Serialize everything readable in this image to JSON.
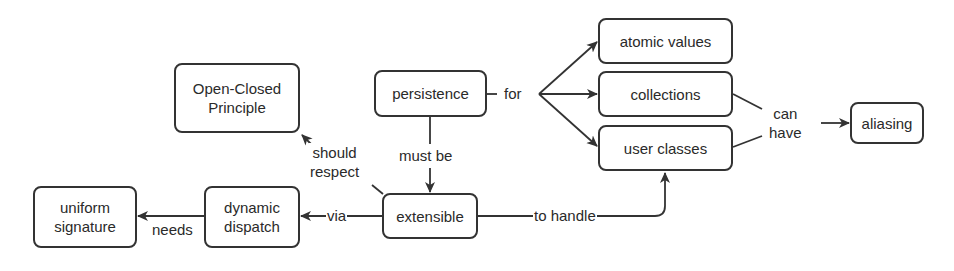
{
  "diagram": {
    "type": "concept-map",
    "stroke_color": "#333333",
    "text_color": "#2a2a2a",
    "nodes": [
      {
        "id": "open_closed",
        "label": "Open-Closed\nPrinciple"
      },
      {
        "id": "persistence",
        "label": "persistence"
      },
      {
        "id": "atomic_values",
        "label": "atomic values"
      },
      {
        "id": "collections",
        "label": "collections"
      },
      {
        "id": "user_classes",
        "label": "user classes"
      },
      {
        "id": "aliasing",
        "label": "aliasing"
      },
      {
        "id": "extensible",
        "label": "extensible"
      },
      {
        "id": "dynamic_dispatch",
        "label": "dynamic\ndispatch"
      },
      {
        "id": "uniform_signature",
        "label": "uniform\nsignature"
      }
    ],
    "edges": [
      {
        "from": "persistence",
        "to": [
          "atomic_values",
          "collections",
          "user_classes"
        ],
        "label": "for"
      },
      {
        "from": "persistence",
        "to": "extensible",
        "label": "must be"
      },
      {
        "from": "extensible",
        "to": "open_closed",
        "label": "should\nrespect"
      },
      {
        "from": "extensible",
        "to": "dynamic_dispatch",
        "label": "via"
      },
      {
        "from": "dynamic_dispatch",
        "to": "uniform_signature",
        "label": "needs"
      },
      {
        "from": "extensible",
        "to": "user_classes",
        "label": "to handle"
      },
      {
        "from": [
          "collections",
          "user_classes"
        ],
        "to": "aliasing",
        "label": "can\nhave"
      }
    ]
  }
}
